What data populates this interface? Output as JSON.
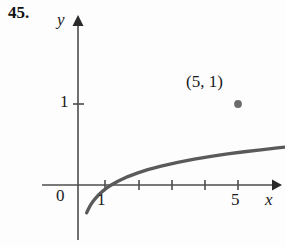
{
  "figure": {
    "problem_number": "45.",
    "axes": {
      "x_label": "x",
      "y_label": "y",
      "origin_label": "0",
      "x_ticks": [
        {
          "value": 1,
          "label": "1",
          "px": 105
        },
        {
          "value": 2,
          "label": "",
          "px": 139
        },
        {
          "value": 3,
          "label": "",
          "px": 172
        },
        {
          "value": 4,
          "label": "",
          "px": 205
        },
        {
          "value": 5,
          "label": "5",
          "px": 238
        }
      ],
      "y_ticks": [
        {
          "value": 1,
          "label": "1",
          "px": 104
        }
      ],
      "x_axis_y_px": 185,
      "y_axis_x_px": 78,
      "unit_px": 33.25,
      "arrowheads": [
        "x-positive",
        "y-positive"
      ]
    },
    "annotations": [
      {
        "name": "marked-point",
        "label": "(5, 1)",
        "x": 5,
        "y": 1
      }
    ],
    "colors": {
      "curve": "#5a5a5a",
      "axis": "#4d4d4d",
      "text": "#1a1a1a",
      "background": "#fdfdfd"
    }
  },
  "chart_data": {
    "type": "line",
    "title": "",
    "xlabel": "x",
    "ylabel": "y",
    "xlim": [
      -0.3,
      6.3
    ],
    "ylim": [
      -2.0,
      1.6
    ],
    "grid": false,
    "legend": null,
    "series": [
      {
        "name": "y = log_5(x)",
        "x": [
          0.26,
          0.3,
          0.35,
          0.4,
          0.45,
          0.5,
          0.6,
          0.7,
          0.8,
          0.9,
          1.0,
          1.2,
          1.5,
          1.8,
          2.1,
          2.5,
          3.0,
          3.5,
          4.0,
          4.5,
          5.0,
          5.5,
          6.0,
          6.3
        ],
        "y": [
          -0.837,
          -0.748,
          -0.652,
          -0.569,
          -0.496,
          -0.431,
          -0.317,
          -0.222,
          -0.139,
          -0.065,
          0.0,
          0.113,
          0.252,
          0.365,
          0.461,
          0.569,
          0.683,
          0.778,
          0.861,
          0.934,
          1.0,
          1.059,
          1.114,
          1.144
        ]
      }
    ],
    "points": [
      {
        "x": 5,
        "y": 1,
        "label": "(5, 1)",
        "marker": "filled-circle"
      }
    ],
    "xticks": [
      1,
      2,
      3,
      4,
      5
    ],
    "xticklabels": [
      "1",
      "",
      "",
      "",
      "5"
    ],
    "yticks": [
      1
    ],
    "yticklabels": [
      "1"
    ]
  }
}
